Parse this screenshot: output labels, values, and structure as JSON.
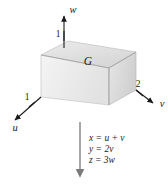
{
  "figure": {
    "solid_label": "G",
    "axes": [
      {
        "name": "u-axis",
        "label": "u",
        "tick_label": "1"
      },
      {
        "name": "v-axis",
        "label": "v",
        "tick_label": "2"
      },
      {
        "name": "w-axis",
        "label": "w",
        "tick_label": "1"
      }
    ],
    "axis_labels": {
      "u": "u",
      "v": "v",
      "w": "w"
    },
    "tick_labels": {
      "u": "1",
      "v": "2",
      "w": "1"
    },
    "equations": [
      "x = u + v",
      "y = 2v",
      "z = 3w"
    ],
    "arrow": {
      "name": "downward-mapping-arrow",
      "direction": "down"
    },
    "colors": {
      "stroke": "#1a1a1a",
      "box_edge": "#9a9a9a",
      "face_top": "#e3e3e3",
      "face_left": "#efefef",
      "face_front": "#dcdcdc",
      "background": "#ffffff"
    }
  }
}
